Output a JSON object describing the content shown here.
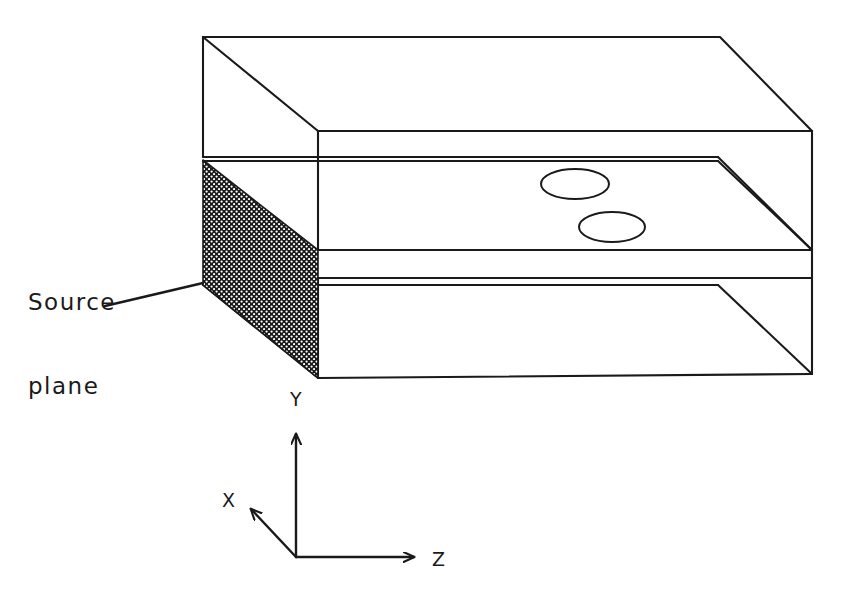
{
  "figure": {
    "type": "technical-line-diagram",
    "background_color": "#ffffff",
    "line_color": "#1a1a1a"
  },
  "annotations": {
    "source_plane": {
      "line1": "Source",
      "line2": "plane",
      "full_text": "Source plane",
      "leader_from": [
        105,
        306
      ],
      "leader_to": [
        203,
        283
      ]
    }
  },
  "axes": {
    "origin": [
      296,
      557
    ],
    "items": [
      {
        "label": "Y",
        "direction": "up",
        "tip": [
          296,
          428
        ]
      },
      {
        "label": "X",
        "direction": "up-left",
        "tip": [
          247,
          504
        ]
      },
      {
        "label": "Z",
        "direction": "right",
        "tip": [
          420,
          557
        ]
      }
    ]
  },
  "geometry": {
    "projection": "oblique",
    "depth_offset": [
      115,
      -94
    ],
    "front_face": {
      "left": 318,
      "right": 812,
      "top": 131,
      "bottom": 374
    },
    "layer_boundaries_front_y": [
      131,
      250,
      278,
      374
    ],
    "layers": [
      {
        "name": "top-layer",
        "front_top": 131,
        "front_bottom": 250
      },
      {
        "name": "middle-layer",
        "front_top": 250,
        "front_bottom": 278
      },
      {
        "name": "bottom-layer",
        "front_top": 278,
        "front_bottom": 374
      }
    ],
    "source_plane_polygon": [
      [
        203,
        160
      ],
      [
        318,
        250
      ],
      [
        318,
        378
      ],
      [
        203,
        285
      ]
    ],
    "source_plane_fill": "crosshatch-dots",
    "ellipses": [
      {
        "name": "inclusion-1",
        "cx": 575,
        "cy": 184,
        "rx": 34,
        "ry": 15
      },
      {
        "name": "inclusion-2",
        "cx": 612,
        "cy": 227,
        "rx": 33,
        "ry": 15
      }
    ]
  }
}
